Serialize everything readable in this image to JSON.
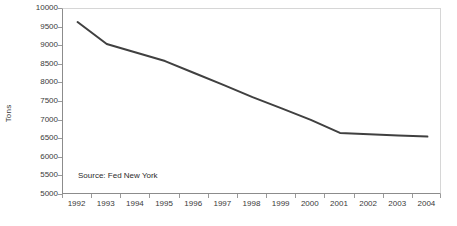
{
  "chart_data": {
    "type": "line",
    "title": "",
    "xlabel": "",
    "ylabel": "Tons",
    "categories": [
      "1992",
      "1993",
      "1994",
      "1995",
      "1996",
      "1997",
      "1998",
      "1999",
      "2000",
      "2001",
      "2002",
      "2003",
      "2004"
    ],
    "values": [
      9650,
      9060,
      8830,
      8600,
      8280,
      7960,
      7630,
      7330,
      7020,
      6670,
      6630,
      6600,
      6570
    ],
    "series": [
      {
        "name": "Tons",
        "values": [
          9650,
          9060,
          8830,
          8600,
          8280,
          7960,
          7630,
          7330,
          7020,
          6670,
          6630,
          6600,
          6570
        ]
      }
    ],
    "ylim": [
      5000,
      10000
    ],
    "ytick_step": 500,
    "yticks": [
      "10000",
      "9500",
      "9000",
      "8500",
      "8000",
      "7500",
      "7000",
      "6500",
      "6000",
      "5500",
      "5000"
    ],
    "ytick_values": [
      10000,
      9500,
      9000,
      8500,
      8000,
      7500,
      7000,
      6500,
      6000,
      5500,
      5000
    ],
    "grid": false,
    "legend": false,
    "legend_position": "none",
    "line_color": "#404040",
    "line_width": 2,
    "annotations": [
      {
        "name": "source-note",
        "text": "Source: Fed New York"
      }
    ]
  },
  "colors": {
    "line": "#404040",
    "axis": "#8c8c8c",
    "plot_border": "#d6d6d6",
    "tick": "#9a9a9a",
    "text": "#3a3a3a",
    "background": "#ffffff"
  }
}
